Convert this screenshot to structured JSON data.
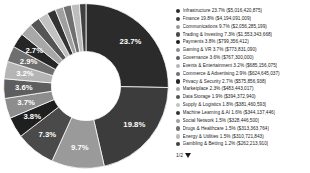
{
  "chart_data": {
    "type": "pie",
    "title": "",
    "subtitle": "",
    "xlabel": "",
    "ylabel": "",
    "donut": true,
    "hole_ratio": 0.42,
    "legend_position": "right",
    "grid": false,
    "value_unit": "USD",
    "labels_on_slices": true,
    "categories": [
      "Infrastructure",
      "Finance",
      "Communications",
      "Trading & Investing",
      "Payments",
      "Gaming & VR",
      "Governance",
      "Events & Entertainment",
      "Commerce & Advertising",
      "Privacy & Security",
      "Marketplace",
      "Data Storage",
      "Supply & Logistics",
      "Machine Learning & AI",
      "Social Network",
      "Drugs & Healthcare",
      "Energy & Utilities",
      "Gambling & Betting"
    ],
    "percentages": [
      23.7,
      19.8,
      9.7,
      7.3,
      3.8,
      3.7,
      3.6,
      3.2,
      2.9,
      2.7,
      2.3,
      1.9,
      1.8,
      1.6,
      1.5,
      1.5,
      1.5,
      1.2
    ],
    "values": [
      5016420875,
      4194091009,
      2056285199,
      1553343668,
      799356412,
      773831090,
      767300000,
      685156075,
      624645037,
      575856938,
      483443017,
      394372940,
      381460593,
      344137446,
      328446500,
      313363764,
      310721843,
      262213910
    ],
    "value_strings": [
      "$5,016,420,875",
      "$4,194,091,009",
      "$2,056,285,199",
      "$1,553,343,668",
      "$799,356,412",
      "$773,831,090",
      "$767,300,000",
      "$685,156,075",
      "$624,645,037",
      "$575,856,938",
      "$483,443,017",
      "$394,372,940",
      "$381,460,593",
      "$344,137,446",
      "$328,446,500",
      "$313,363,764",
      "$310,721,843",
      "$262,213,910"
    ],
    "colors": [
      "#2b2b2b",
      "#3c3c3c",
      "#9a9a9a",
      "#4a4a4a",
      "#1f1f1f",
      "#8d8d8d",
      "#5e5e5e",
      "#b5b5b5",
      "#6f6f6f",
      "#262626",
      "#a8a8a8",
      "#555555",
      "#c2c2c2",
      "#333333",
      "#9f9f9f",
      "#707070",
      "#bdbdbd",
      "#404040"
    ],
    "slice_labels": [
      "23.7%",
      "19.8%",
      "9.7%",
      "7.3%",
      "3.8%",
      "3.7%",
      "3.6%",
      "3.2%",
      "2.9%",
      "2.7%",
      "",
      "",
      "",
      "",
      "",
      "",
      "",
      ""
    ]
  },
  "legend": {
    "items": [
      {
        "label": "Infrastructure 23.7% ($5,016,420,875)",
        "color": "#2b2b2b"
      },
      {
        "label": "Finance 19.8% ($4,194,091,009)",
        "color": "#3c3c3c"
      },
      {
        "label": "Communications 9.7% ($2,056,285,199)",
        "color": "#9a9a9a"
      },
      {
        "label": "Trading & Investing 7.3% ($1,553,343,668)",
        "color": "#4a4a4a"
      },
      {
        "label": "Payments 3.8% ($799,356,412)",
        "color": "#1f1f1f"
      },
      {
        "label": "Gaming & VR 3.7% ($773,831,090)",
        "color": "#8d8d8d"
      },
      {
        "label": "Governance 3.6% ($767,300,000)",
        "color": "#5e5e5e"
      },
      {
        "label": "Events & Entertainment 3.2% ($685,156,075)",
        "color": "#b5b5b5"
      },
      {
        "label": "Commerce & Advertising 2.9% ($624,645,037)",
        "color": "#6f6f6f"
      },
      {
        "label": "Privacy & Security 2.7% ($575,856,938)",
        "color": "#262626"
      },
      {
        "label": "Marketplace 2.3% ($483,443,017)",
        "color": "#a8a8a8"
      },
      {
        "label": "Data Storage 1.9% ($394,372,940)",
        "color": "#555555"
      },
      {
        "label": "Supply & Logistics 1.8% ($381,460,593)",
        "color": "#c2c2c2"
      },
      {
        "label": "Machine Learning & AI 1.6% ($344,137,446)",
        "color": "#333333"
      },
      {
        "label": "Social Network 1.5% ($328,446,500)",
        "color": "#9f9f9f"
      },
      {
        "label": "Drugs & Healthcare 1.5% ($313,363,764)",
        "color": "#707070"
      },
      {
        "label": "Energy & Utilities 1.5% ($310,721,843)",
        "color": "#bdbdbd"
      },
      {
        "label": "Gambling & Betting 1.2% ($262,213,910)",
        "color": "#404040"
      }
    ]
  },
  "pager": {
    "label": "1/2",
    "caret_icon": "chevron-down-icon"
  }
}
